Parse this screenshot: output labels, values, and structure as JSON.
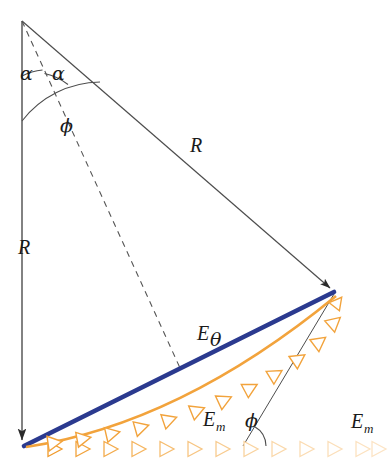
{
  "figure": {
    "background_color": "#ffffff"
  },
  "colors": {
    "outline": "#4d4d4d",
    "dashed": "#555555",
    "resultant_blue": "#2b3a8f",
    "arrow_orange": "#f2a33c",
    "arrow_orange_faded": "#f7d79a",
    "label_text": "#1a1a1a"
  },
  "geometry": {
    "apex": {
      "x": 22,
      "y": 21
    },
    "bottom_left": {
      "x": 22,
      "y": 446
    },
    "right_vertex": {
      "x": 335,
      "y": 292
    },
    "dashed_end": {
      "x": 180,
      "y": 368
    },
    "phi_line_start": {
      "x": 248,
      "y": 446
    }
  },
  "labels": {
    "radius_left": {
      "text": "R",
      "x": 25,
      "y": 254
    },
    "radius_right": {
      "text": "R",
      "x": 196,
      "y": 152
    },
    "alpha_left": {
      "text": "α",
      "x": 22,
      "y": 79
    },
    "alpha_right": {
      "text": "α",
      "x": 53,
      "y": 79
    },
    "phi_apex": {
      "text": "ϕ",
      "x": 61,
      "y": 131
    },
    "phi_base": {
      "text": "ϕ",
      "x": 248,
      "y": 426
    },
    "e_theta": {
      "text": "E",
      "sub": "θ",
      "x": 198,
      "y": 340
    },
    "e_m_diagonal": {
      "text": "E",
      "sub": "m",
      "x": 204,
      "y": 426
    },
    "e_m_horizontal": {
      "text": "E",
      "sub": "m",
      "x": 352,
      "y": 428
    }
  },
  "elements": {
    "vertical_radius": "left vertical radius line with downward arrowhead",
    "slant_radius": "upper-right slant radius line with arrowhead at right vertex",
    "chord": "blue resultant vector E-theta from bottom-left to right vertex",
    "element_chain_diagonal": "chain of orange element vectors E_m curving up to right vertex",
    "element_chain_horizontal": "chain of faded orange element vectors E_m along the baseline",
    "bisector": "dashed bisector from apex to the blue chord",
    "arc_alpha_left": "small arc marking left alpha angle",
    "arc_alpha_right": "small arc marking right alpha angle",
    "arc_phi_apex": "large arc marking phi angle at apex",
    "arc_phi_base": "small arc marking phi angle at baseline",
    "phi_reference_line": "thin line from baseline to right vertex forming phi"
  },
  "arrow_counts": {
    "diagonal_chain": 11,
    "horizontal_chain": 13
  }
}
